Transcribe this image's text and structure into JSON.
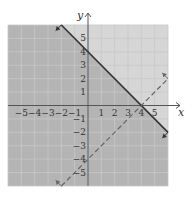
{
  "chart_data": {
    "type": "line",
    "title": "",
    "xlabel": "x",
    "ylabel": "y",
    "xlim": [
      -6,
      6
    ],
    "ylim": [
      -6,
      6
    ],
    "grid": true,
    "x_ticks": [
      "-5",
      "-4",
      "-3",
      "-2",
      "-1",
      "1",
      "2",
      "3",
      "4",
      "5"
    ],
    "y_ticks": [
      "5",
      "4",
      "3",
      "2",
      "1",
      "-1",
      "-2",
      "-3",
      "-4",
      "-5"
    ],
    "series": [
      {
        "name": "boundary solid",
        "equation": "y = -x + 4",
        "style": "solid",
        "points": [
          [
            -2,
            6
          ],
          [
            6,
            -2
          ]
        ]
      },
      {
        "name": "boundary dashed",
        "equation": "y = x - 4",
        "style": "dashed",
        "points": [
          [
            -2,
            -6
          ],
          [
            6,
            2
          ]
        ]
      }
    ],
    "shading": {
      "darker_region": "y <= -x + 4",
      "lighter_region": "y > -x + 4"
    },
    "colors": {
      "dark_shade": "#b4b4b4",
      "light_shade": "#d6d6d6",
      "grid": "#c8c8c8",
      "line": "#333333",
      "dashed": "#666666"
    }
  }
}
